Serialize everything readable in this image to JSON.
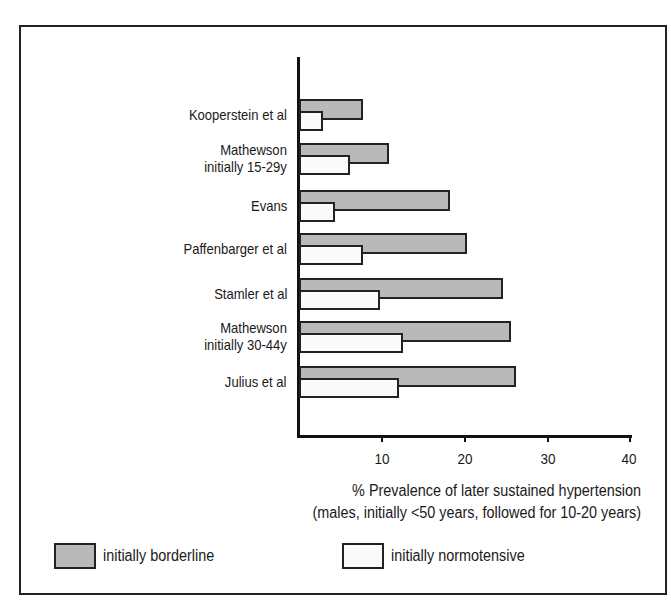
{
  "chart_data": {
    "type": "bar",
    "orientation": "horizontal",
    "title": "",
    "xlabel": "% Prevalence of later sustained hypertension",
    "xlabel_subtitle": "(males, initially <50 years, followed for 10-20 years)",
    "ylabel": "",
    "xlim": [
      0,
      40
    ],
    "xticks": [
      10,
      20,
      30,
      40
    ],
    "grid": false,
    "legend_position": "bottom",
    "categories": [
      "Kooperstein et al",
      "Mathewson initially 15-29y",
      "Evans",
      "Paffenbarger et al",
      "Stamler et al",
      "Mathewson initially 30-44y",
      "Julius et al"
    ],
    "series": [
      {
        "name": "initially borderline",
        "color": "#b9b9b9",
        "values": [
          7.7,
          10.8,
          18.2,
          20.2,
          24.6,
          25.6,
          26.1
        ]
      },
      {
        "name": "initially normotensive",
        "color": "#fafafa",
        "values": [
          2.9,
          6.1,
          4.3,
          7.7,
          9.8,
          12.5,
          12.0
        ]
      }
    ]
  },
  "labels": [
    {
      "lines": [
        "Kooperstein et al"
      ]
    },
    {
      "lines": [
        "Mathewson",
        "initially 15-29y"
      ]
    },
    {
      "lines": [
        "Evans"
      ]
    },
    {
      "lines": [
        "Paffenbarger et al"
      ]
    },
    {
      "lines": [
        "Stamler et al"
      ]
    },
    {
      "lines": [
        "Mathewson",
        "initially 30-44y"
      ]
    },
    {
      "lines": [
        "Julius et al"
      ]
    }
  ],
  "ticks": [
    "10",
    "20",
    "30",
    "40"
  ],
  "axis_title": {
    "line1": "% Prevalence of later sustained hypertension",
    "line2": "(males, initially <50 years, followed for 10-20 years)"
  },
  "legend": {
    "borderline": "initially borderline",
    "normotensive": "initially normotensive"
  }
}
